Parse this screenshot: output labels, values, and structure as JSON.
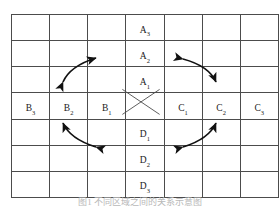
{
  "figure": {
    "type": "grid-diagram",
    "grid": {
      "rows": 7,
      "cols": 7,
      "border_color": "#4c4c4c",
      "background": "#ffffff"
    },
    "caption": "图1  不同区域之间的关系示意图"
  },
  "cells": {
    "vertical_axis_top": [
      {
        "base": "A",
        "sub": "3",
        "row": 1,
        "col": 4
      },
      {
        "base": "A",
        "sub": "2",
        "row": 2,
        "col": 4
      },
      {
        "base": "A",
        "sub": "1",
        "row": 3,
        "col": 4
      }
    ],
    "horizontal_axis_left": [
      {
        "base": "B",
        "sub": "3",
        "row": 4,
        "col": 1
      },
      {
        "base": "B",
        "sub": "2",
        "row": 4,
        "col": 2
      },
      {
        "base": "B",
        "sub": "1",
        "row": 4,
        "col": 3
      }
    ],
    "horizontal_axis_right": [
      {
        "base": "C",
        "sub": "1",
        "row": 4,
        "col": 5
      },
      {
        "base": "C",
        "sub": "2",
        "row": 4,
        "col": 6
      },
      {
        "base": "C",
        "sub": "3",
        "row": 4,
        "col": 7
      }
    ],
    "vertical_axis_bottom": [
      {
        "base": "D",
        "sub": "1",
        "row": 5,
        "col": 4
      },
      {
        "base": "D",
        "sub": "2",
        "row": 6,
        "col": 4
      },
      {
        "base": "D",
        "sub": "3",
        "row": 7,
        "col": 4
      }
    ],
    "center": {
      "row": 4,
      "col": 4,
      "marking": "x-cross-diagonals"
    }
  },
  "arrows": [
    {
      "name": "arrow-top-left",
      "quadrant": "top-left",
      "direction": "bidirectional",
      "orientation": "sw-ne"
    },
    {
      "name": "arrow-top-right",
      "quadrant": "top-right",
      "direction": "bidirectional",
      "orientation": "nw-se"
    },
    {
      "name": "arrow-bottom-left",
      "quadrant": "bottom-left",
      "direction": "bidirectional",
      "orientation": "nw-se"
    },
    {
      "name": "arrow-bottom-right",
      "quadrant": "bottom-right",
      "direction": "bidirectional",
      "orientation": "sw-ne"
    }
  ],
  "colors": {
    "grid_line": "#4c4c4c",
    "text": "#1a1a1a",
    "arrow": "#111111",
    "caption": "#b9b9b9",
    "background": "#ffffff"
  }
}
